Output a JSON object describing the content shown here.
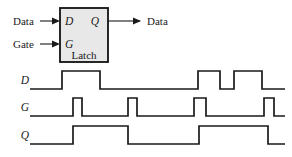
{
  "figure": {
    "background_color": "#ffffff",
    "line_color": "#1a1a1a",
    "block_fill_color": "#e8e8e8"
  },
  "block_diagram": {
    "box_label": "Latch",
    "pins": {
      "d_input": "D",
      "g_input": "G",
      "q_output": "Q"
    },
    "external_labels": {
      "data_in": "Data",
      "gate_in": "Gate",
      "data_out": "Data"
    },
    "box": {
      "x": 60,
      "y": 8,
      "width": 48,
      "height": 54
    },
    "input_wires": [
      {
        "name": "data-wire",
        "x1": 40,
        "y1": 21,
        "x2": 60,
        "y2": 21
      },
      {
        "name": "gate-wire",
        "x1": 40,
        "y1": 44,
        "x2": 60,
        "y2": 44
      }
    ],
    "output_wires": [
      {
        "name": "q-wire",
        "x1": 108,
        "y1": 21,
        "x2": 140,
        "y2": 21
      }
    ]
  },
  "timing_diagram": {
    "signals": [
      {
        "name": "D",
        "label": "D",
        "baseline_y": 89,
        "high_y": 71,
        "x_start": 30,
        "x_end": 285,
        "description": "Data input waveform",
        "transitions": [
          {
            "x": 30,
            "level": 0
          },
          {
            "x": 62,
            "level": 1
          },
          {
            "x": 100,
            "level": 0
          },
          {
            "x": 198,
            "level": 1
          },
          {
            "x": 220,
            "level": 0
          },
          {
            "x": 234,
            "level": 1
          },
          {
            "x": 262,
            "level": 0
          },
          {
            "x": 285,
            "level": 0
          }
        ]
      },
      {
        "name": "G",
        "label": "G",
        "baseline_y": 116,
        "high_y": 98,
        "x_start": 30,
        "x_end": 285,
        "description": "Gate enable waveform",
        "transitions": [
          {
            "x": 30,
            "level": 0
          },
          {
            "x": 73,
            "level": 1
          },
          {
            "x": 82,
            "level": 0
          },
          {
            "x": 128,
            "level": 1
          },
          {
            "x": 137,
            "level": 0
          },
          {
            "x": 194,
            "level": 1
          },
          {
            "x": 206,
            "level": 0
          },
          {
            "x": 264,
            "level": 1
          },
          {
            "x": 274,
            "level": 0
          },
          {
            "x": 285,
            "level": 0
          }
        ]
      },
      {
        "name": "Q",
        "label": "Q",
        "baseline_y": 144,
        "high_y": 126,
        "x_start": 30,
        "x_end": 285,
        "description": "Latched output waveform",
        "transitions": [
          {
            "x": 30,
            "level": 0
          },
          {
            "x": 73,
            "level": 1
          },
          {
            "x": 128,
            "level": 0
          },
          {
            "x": 199,
            "level": 1
          },
          {
            "x": 268,
            "level": 0
          },
          {
            "x": 285,
            "level": 0
          }
        ]
      }
    ]
  }
}
